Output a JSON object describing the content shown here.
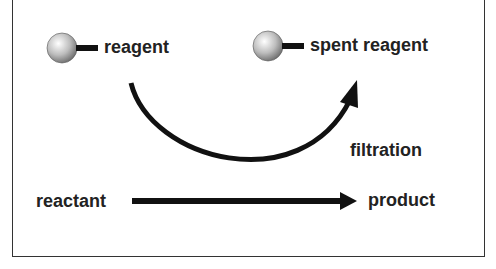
{
  "diagram": {
    "reagent_label": "reagent",
    "spent_reagent_label": "spent reagent",
    "filtration_label": "filtration",
    "reactant_label": "reactant",
    "product_label": "product"
  },
  "colors": {
    "stroke": "#111111",
    "text": "#222222",
    "sphere_light": "#ffffff",
    "sphere_dark": "#777777"
  }
}
